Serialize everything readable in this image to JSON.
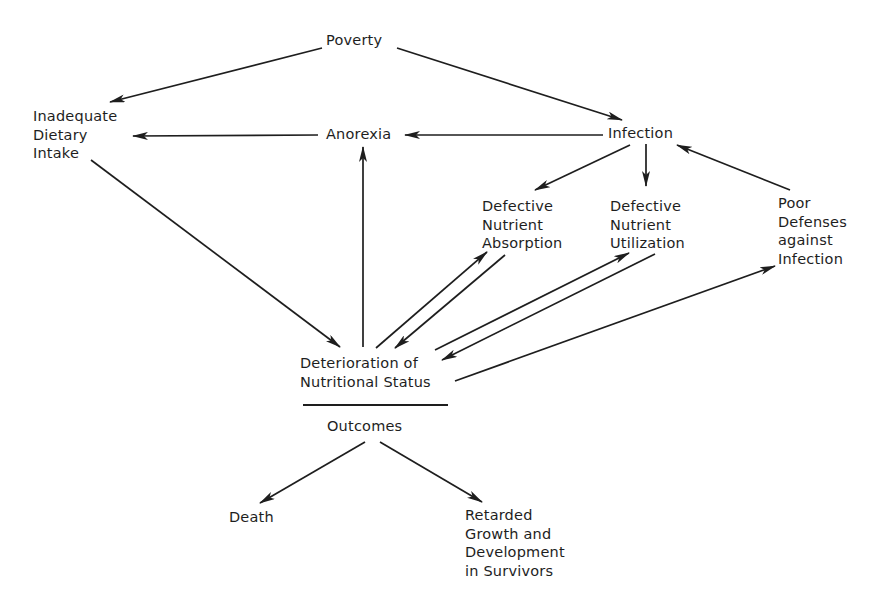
{
  "diagram": {
    "type": "flow-cycle",
    "colors": {
      "background": "#ffffff",
      "ink": "#1e1e1e"
    },
    "nodes": {
      "poverty": {
        "lines": [
          "Poverty"
        ]
      },
      "inadequate_dietary_intake": {
        "lines": [
          "Inadequate",
          "Dietary",
          "Intake"
        ]
      },
      "anorexia": {
        "lines": [
          "Anorexia"
        ]
      },
      "infection": {
        "lines": [
          "Infection"
        ]
      },
      "defective_nutrient_absorption": {
        "lines": [
          "Defective",
          "Nutrient",
          "Absorption"
        ]
      },
      "defective_nutrient_utilization": {
        "lines": [
          "Defective",
          "Nutrient",
          "Utilization"
        ]
      },
      "poor_defenses_against_infection": {
        "lines": [
          "Poor",
          "Defenses",
          "against",
          "Infection"
        ]
      },
      "deterioration_of_nutritional_status": {
        "lines": [
          "Deterioration of",
          "Nutritional Status"
        ]
      },
      "outcomes": {
        "lines": [
          "Outcomes"
        ]
      },
      "death": {
        "lines": [
          "Death"
        ]
      },
      "retarded_growth": {
        "lines": [
          "Retarded",
          "Growth and",
          "Development",
          "in Survivors"
        ]
      }
    },
    "edges": [
      {
        "from": "Poverty",
        "to": "Inadequate Dietary Intake"
      },
      {
        "from": "Poverty",
        "to": "Infection"
      },
      {
        "from": "Anorexia",
        "to": "Inadequate Dietary Intake"
      },
      {
        "from": "Infection",
        "to": "Anorexia"
      },
      {
        "from": "Infection",
        "to": "Defective Nutrient Absorption"
      },
      {
        "from": "Infection",
        "to": "Defective Nutrient Utilization"
      },
      {
        "from": "Poor Defenses against Infection",
        "to": "Infection"
      },
      {
        "from": "Inadequate Dietary Intake",
        "to": "Deterioration of Nutritional Status"
      },
      {
        "from": "Deterioration of Nutritional Status",
        "to": "Anorexia"
      },
      {
        "from": "Deterioration of Nutritional Status",
        "to": "Defective Nutrient Absorption"
      },
      {
        "from": "Defective Nutrient Absorption",
        "to": "Deterioration of Nutritional Status"
      },
      {
        "from": "Deterioration of Nutritional Status",
        "to": "Defective Nutrient Utilization"
      },
      {
        "from": "Defective Nutrient Utilization",
        "to": "Deterioration of Nutritional Status"
      },
      {
        "from": "Deterioration of Nutritional Status",
        "to": "Poor Defenses against Infection"
      },
      {
        "from": "Outcomes",
        "to": "Death"
      },
      {
        "from": "Outcomes",
        "to": "Retarded Growth and Development in Survivors"
      }
    ]
  }
}
